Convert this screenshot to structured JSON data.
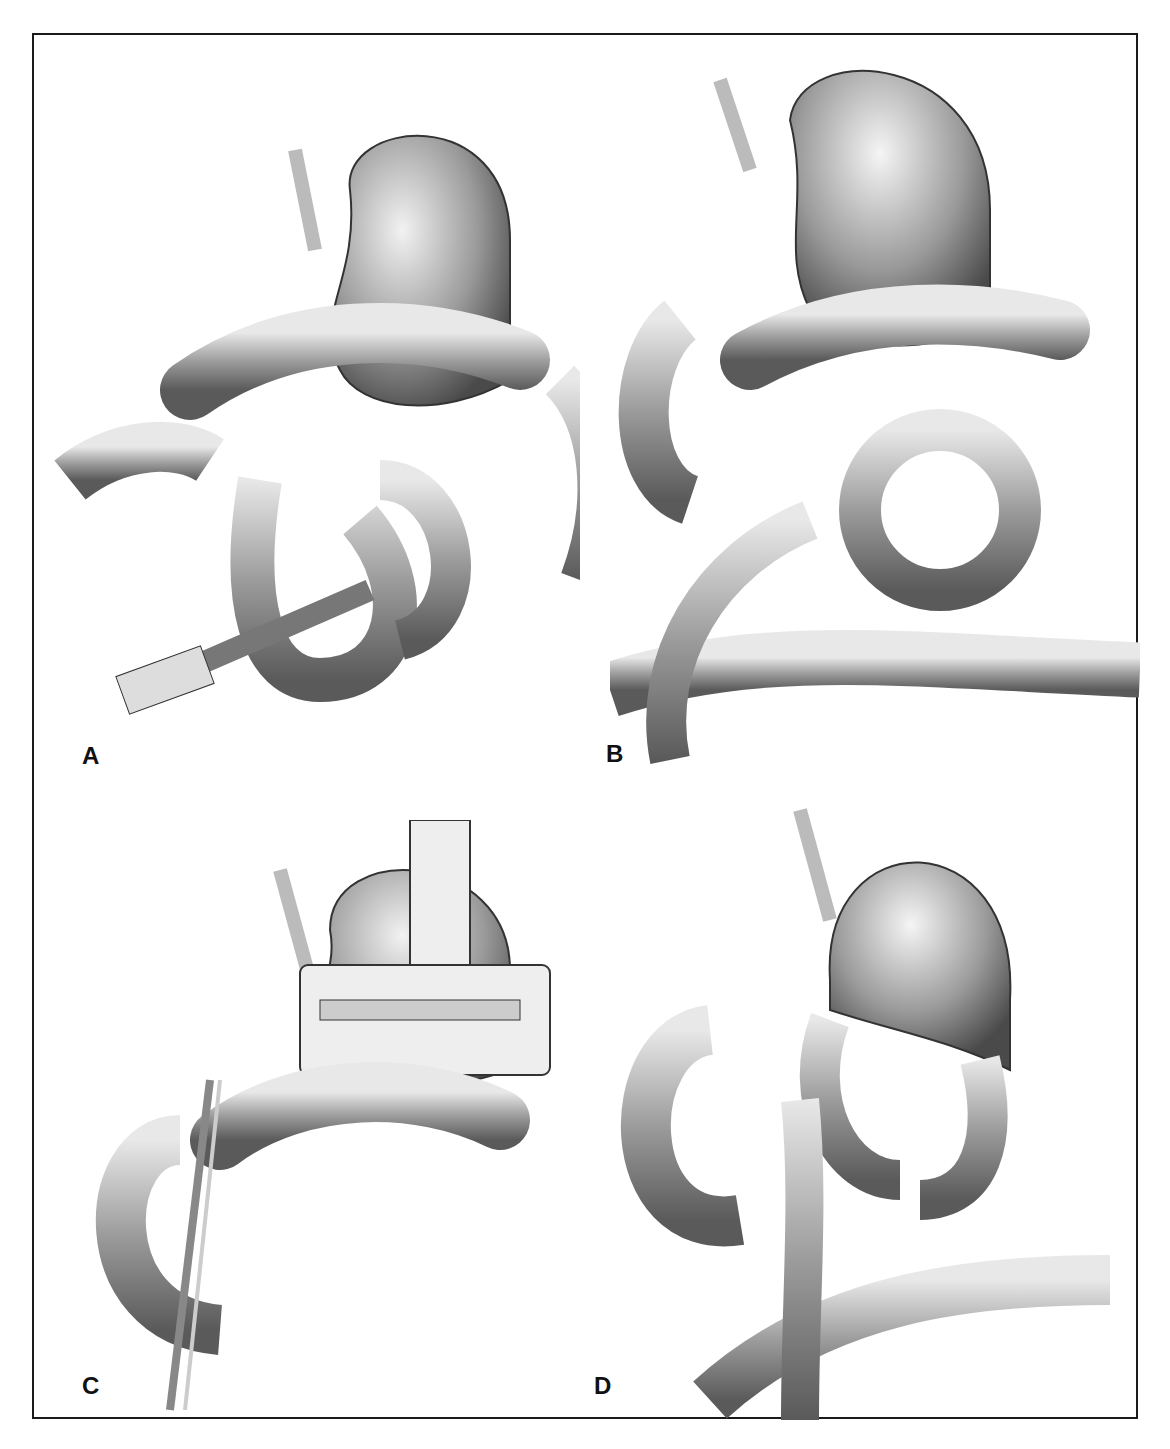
{
  "figure": {
    "panels": [
      {
        "id": "A",
        "label": "A",
        "description": "Gastric and jejunal loops with stapler instrument dividing bowel"
      },
      {
        "id": "B",
        "label": "B",
        "description": "Reconstructed stomach with looped bowel anastomoses and colon below"
      },
      {
        "id": "C",
        "label": "C",
        "description": "Stapler clamp applied across stomach with retracting instrument"
      },
      {
        "id": "D",
        "label": "D",
        "description": "Gastric pouch with Roux limb anastomosis and stapled segments"
      }
    ],
    "colors": {
      "border": "#1a1a1a",
      "organ_dark": "#555555",
      "organ_mid": "#9a9a9a",
      "organ_light": "#e6e6e6",
      "background": "#ffffff"
    }
  }
}
